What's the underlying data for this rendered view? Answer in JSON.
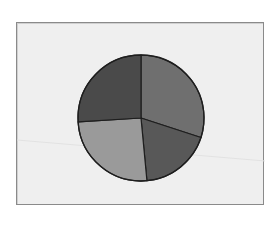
{
  "chart_data": {
    "type": "pie",
    "title": "",
    "labels": [
      "Slice 1",
      "Slice 2",
      "Slice 3",
      "Slice 4"
    ],
    "values": [
      30,
      18.5,
      25.5,
      26
    ],
    "colors": [
      "#6f6f6f",
      "#585858",
      "#9a9a9a",
      "#4a4a4a"
    ],
    "start_angle_deg": 0,
    "direction": "clockwise",
    "legend": "none",
    "data_labels": "none"
  },
  "style": {
    "background": "#efefef",
    "frame_border": "#8a8a8a",
    "slice_edge": "#1e1e1e"
  },
  "geometry": {
    "cx": 124,
    "cy": 95,
    "r": 63
  }
}
